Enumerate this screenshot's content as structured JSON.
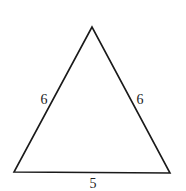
{
  "diagram": {
    "type": "triangle",
    "stroke_color": "#1a1a1a",
    "vertices": {
      "apex": [
        92,
        27
      ],
      "bottom_left": [
        14,
        172
      ],
      "bottom_right": [
        170,
        173
      ]
    },
    "sides": [
      {
        "name": "left",
        "label": "6",
        "label_pos": [
          44,
          104
        ]
      },
      {
        "name": "right",
        "label": "6",
        "label_pos": [
          140,
          104
        ]
      },
      {
        "name": "base",
        "label": "5",
        "label_pos": [
          93,
          188
        ]
      }
    ]
  }
}
